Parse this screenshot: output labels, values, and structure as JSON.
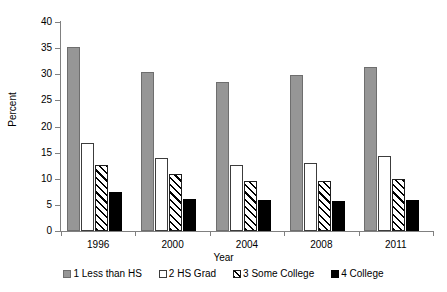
{
  "chart_data": {
    "type": "bar",
    "title": "",
    "xlabel": "Year",
    "ylabel": "Percent",
    "categories": [
      "1996",
      "2000",
      "2004",
      "2008",
      "2011"
    ],
    "series": [
      {
        "name": "1 Less than HS",
        "values": [
          35.3,
          30.4,
          28.5,
          29.8,
          31.4
        ],
        "fill": "#969696",
        "pattern": "solid-gray"
      },
      {
        "name": "2 HS Grad",
        "values": [
          16.9,
          14.0,
          12.7,
          13.1,
          14.3
        ],
        "fill": "#ffffff",
        "pattern": "outline-white"
      },
      {
        "name": "3 Some College",
        "values": [
          12.7,
          10.9,
          9.5,
          9.5,
          10.0
        ],
        "fill": "#ffffff",
        "pattern": "diagonal-hatch"
      },
      {
        "name": "4 College",
        "values": [
          7.4,
          6.2,
          6.0,
          5.8,
          6.0
        ],
        "fill": "#000000",
        "pattern": "solid-black"
      }
    ],
    "ylim": [
      0,
      40
    ],
    "yticks": [
      0,
      5,
      10,
      15,
      20,
      25,
      30,
      35,
      40
    ],
    "ytick_labels": [
      "0",
      "5",
      "10",
      "15",
      "20",
      "25",
      "30",
      "35",
      "40"
    ],
    "grid": false,
    "legend_position": "bottom"
  },
  "axes": {
    "y_title": "Percent",
    "x_title": "Year"
  },
  "legend": {
    "entries": [
      {
        "label": "1 Less than HS"
      },
      {
        "label": "2 HS Grad"
      },
      {
        "label": "3 Some College"
      },
      {
        "label": "4 College"
      }
    ]
  },
  "colors": {
    "less_than_hs": "#969696",
    "hs_grad": "#ffffff",
    "some_college": "#ffffff",
    "college": "#000000",
    "axis": "#808080",
    "background": "#ffffff"
  }
}
